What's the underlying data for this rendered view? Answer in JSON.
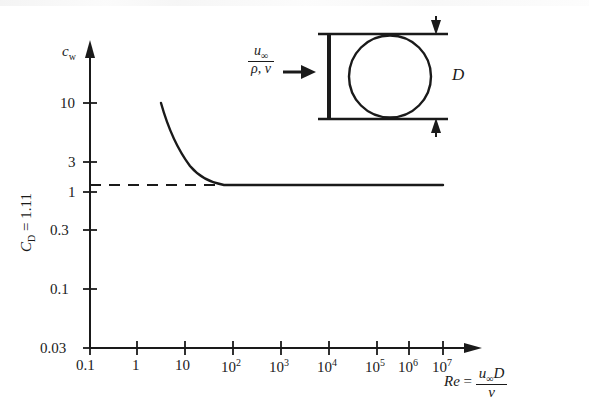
{
  "figure": {
    "domain": "chart",
    "background_color": "#ffffff",
    "ink_color": "#1a1a1a"
  },
  "axis_labels": {
    "y_axis_symbol": "c",
    "y_axis_subscript": "w",
    "x_axis_name": "Re",
    "x_axis_equals": "=",
    "x_axis_numerator_u": "u",
    "x_axis_numerator_inf": "∞",
    "x_axis_numerator_D": "D",
    "x_axis_denominator": "ν",
    "left_rotated_C": "C",
    "left_rotated_sub": "D",
    "left_rotated_value": " = 1.11"
  },
  "inset": {
    "flow_numerator_u": "u",
    "flow_numerator_inf": "∞",
    "flow_denominator": "ρ, ν",
    "diameter_label": "D"
  },
  "chart_data": {
    "type": "line",
    "title": "",
    "xlabel": "Re = u∞D/ν",
    "ylabel": "c_w",
    "xscale": "log",
    "yscale": "log",
    "xlim": [
      0.1,
      10000000
    ],
    "ylim": [
      0.03,
      20
    ],
    "grid": false,
    "legend": null,
    "x_tick_labels": [
      "0.1",
      "1",
      "10",
      "10²",
      "10³",
      "10⁴",
      "10⁵",
      "10⁶",
      "10⁷"
    ],
    "x_tick_values": [
      0.1,
      1,
      10,
      100,
      1000,
      10000,
      100000,
      1000000,
      10000000
    ],
    "y_tick_labels": [
      "0.03",
      "0.1",
      "0.3",
      "1",
      "3",
      "10"
    ],
    "y_tick_values": [
      0.03,
      0.1,
      0.3,
      1,
      3,
      10
    ],
    "series": [
      {
        "name": "drag coefficient c_w of a cylinder",
        "style": "solid",
        "x": [
          3,
          4,
          5,
          6.5,
          8,
          10,
          13,
          17,
          22,
          30,
          40,
          55,
          75,
          100,
          140,
          200,
          300,
          500,
          1000,
          10000,
          100000,
          1000000,
          2000000
        ],
        "y": [
          10.0,
          8.2,
          6.9,
          5.6,
          4.7,
          4.0,
          3.3,
          2.75,
          2.35,
          1.98,
          1.75,
          1.57,
          1.44,
          1.34,
          1.26,
          1.2,
          1.16,
          1.135,
          1.12,
          1.11,
          1.11,
          1.11,
          1.11
        ]
      },
      {
        "name": "asymptote C_D = 1.11",
        "style": "dashed",
        "x": [
          0.1,
          300
        ],
        "y": [
          1.11,
          1.11
        ]
      }
    ],
    "annotations": [
      {
        "text": "C_D = 1.11",
        "role": "asymptote-value",
        "position": "left-rotated"
      }
    ]
  }
}
